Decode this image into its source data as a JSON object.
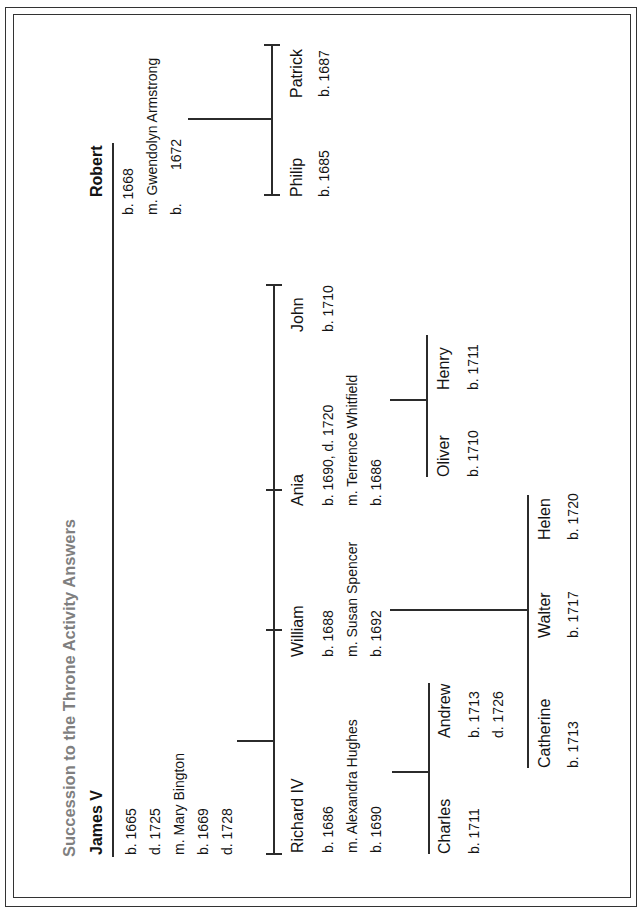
{
  "document": {
    "title": "Succession to the Throne Activity Answers"
  },
  "tree": {
    "james_v": {
      "name": "James V",
      "details": [
        "b. 1665",
        "d. 1725",
        "m. Mary Bington",
        "b. 1669",
        "d. 1728"
      ]
    },
    "robert": {
      "name": "Robert",
      "details": [
        "b. 1668",
        "m. Gwendolyn Armstrong"
      ],
      "spouse_birth": {
        "label": "b.",
        "year": "1672"
      }
    },
    "james_v_children": [
      {
        "name": "Richard IV",
        "details": [
          "b. 1686",
          "m. Alexandra Hughes",
          "b. 1690"
        ]
      },
      {
        "name": "William",
        "details": [
          "b. 1688",
          "m. Susan Spencer",
          "b. 1692"
        ]
      },
      {
        "name": "Ania",
        "details": [
          "b. 1690, d. 1720",
          "m. Terrence Whitfield",
          "b. 1686"
        ]
      },
      {
        "name": "John",
        "details": [
          "b. 1710"
        ]
      }
    ],
    "robert_children": [
      {
        "name": "Philip",
        "details": [
          "b. 1685"
        ]
      },
      {
        "name": "Patrick",
        "details": [
          "b. 1687"
        ]
      }
    ],
    "richard_iv_children": [
      {
        "name": "Charles",
        "details": [
          "b. 1711"
        ]
      },
      {
        "name": "Andrew",
        "details": [
          "b. 1713",
          "d. 1726"
        ]
      }
    ],
    "william_children": [
      {
        "name": "Catherine",
        "details": [
          "b. 1713"
        ]
      },
      {
        "name": "Walter",
        "details": [
          "b. 1717"
        ]
      },
      {
        "name": "Helen",
        "details": [
          "b. 1720"
        ]
      }
    ],
    "ania_children": [
      {
        "name": "Oliver",
        "details": [
          "b. 1710"
        ]
      },
      {
        "name": "Henry",
        "details": [
          "b. 1711"
        ]
      }
    ]
  },
  "colors": {
    "background": "#ffffff",
    "text": "#141414",
    "title": "#7f7f7f",
    "lines": "#2b2b2b",
    "border": "#333333"
  }
}
